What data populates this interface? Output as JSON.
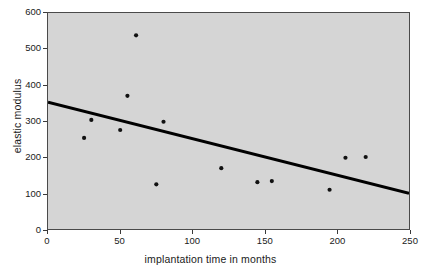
{
  "chart_data": {
    "type": "scatter",
    "title": "",
    "xlabel": "implantation time in months",
    "ylabel": "elastic modulus",
    "xlim": [
      0,
      250
    ],
    "ylim": [
      0,
      600
    ],
    "xticks": [
      0,
      50,
      100,
      150,
      200,
      250
    ],
    "yticks": [
      0,
      100,
      200,
      300,
      400,
      500,
      600
    ],
    "xtick_labels": [
      "0",
      "50",
      "100",
      "150",
      "200",
      "250"
    ],
    "ytick_labels": [
      "0",
      "100",
      "200",
      "300",
      "400",
      "500",
      "600"
    ],
    "grid": false,
    "legend": null,
    "plot_background": "#d5d5d5",
    "marker_color": "#111111",
    "line_color": "#000000",
    "series": [
      {
        "name": "elastic modulus measurements",
        "type": "scatter",
        "points": [
          {
            "x": 25,
            "y": 253
          },
          {
            "x": 30,
            "y": 303
          },
          {
            "x": 50,
            "y": 275
          },
          {
            "x": 55,
            "y": 370
          },
          {
            "x": 61,
            "y": 538
          },
          {
            "x": 75,
            "y": 124
          },
          {
            "x": 80,
            "y": 298
          },
          {
            "x": 120,
            "y": 169
          },
          {
            "x": 145,
            "y": 130
          },
          {
            "x": 155,
            "y": 133
          },
          {
            "x": 195,
            "y": 109
          },
          {
            "x": 206,
            "y": 198
          },
          {
            "x": 220,
            "y": 200
          }
        ]
      },
      {
        "name": "linear regression trend",
        "type": "line",
        "points": [
          {
            "x": 0,
            "y": 352
          },
          {
            "x": 250,
            "y": 99
          }
        ]
      }
    ]
  }
}
